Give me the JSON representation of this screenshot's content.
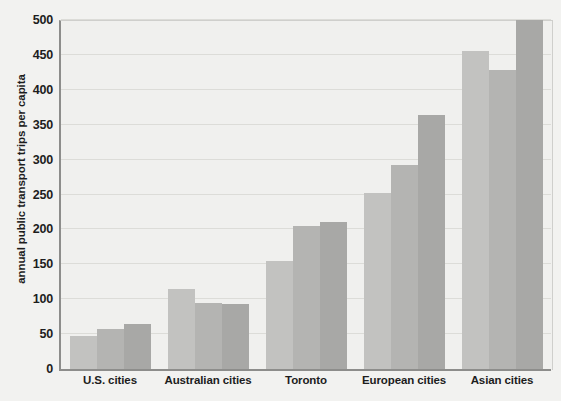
{
  "chart_data": {
    "type": "bar",
    "title": "",
    "subtitle": "",
    "xlabel": "",
    "ylabel": "annual public transport trips per capita",
    "ylim": [
      0,
      500
    ],
    "yticks": [
      0,
      50,
      100,
      150,
      200,
      250,
      300,
      350,
      400,
      450,
      500
    ],
    "ytick_labels": [
      "0",
      "50",
      "100",
      "150",
      "200",
      "250",
      "300",
      "350",
      "400",
      "450",
      "500"
    ],
    "grid": true,
    "legend": "none",
    "categories": [
      "U.S. cities",
      "Australian cities",
      "Toronto",
      "European cities",
      "Asian cities"
    ],
    "series": [
      {
        "name": "series-1",
        "values": [
          48,
          115,
          155,
          252,
          456
        ],
        "color": "#c2c2c0"
      },
      {
        "name": "series-2",
        "values": [
          58,
          94,
          205,
          292,
          428
        ],
        "color": "#b4b4b2"
      },
      {
        "name": "series-3",
        "values": [
          64,
          93,
          211,
          364,
          500
        ],
        "color": "#a8a8a6"
      }
    ]
  },
  "colors": {
    "background": "#f2f2f0",
    "plot_background": "#f0f0ee",
    "axis": "#8d8d8b",
    "gridline": "#dcdcd8",
    "text": "#1d1d1d"
  }
}
